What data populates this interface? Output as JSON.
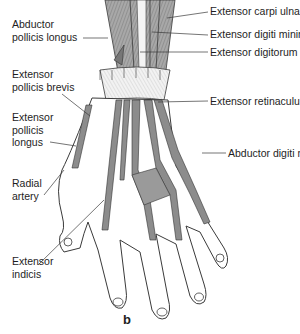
{
  "figure": {
    "subfigure_label": "b",
    "colors": {
      "muscle_fill": "#9a9a9a",
      "tendon_fill": "#8c8c8c",
      "outline": "#3a3a3a",
      "retinaculum_fill": "#f0f0f0",
      "label_text": "#1e1e1e",
      "background": "#ffffff"
    }
  },
  "labels": {
    "left": [
      {
        "line1": "Abductor",
        "line2": "pollicis longus"
      },
      {
        "line1": "Extensor",
        "line2": "pollicis brevis"
      },
      {
        "line1": "Extensor",
        "line2": "pollicis",
        "line3": "longus"
      },
      {
        "line1": "Radial",
        "line2": "artery"
      },
      {
        "line1": "Extensor",
        "line2": "indicis"
      }
    ],
    "right": [
      {
        "text": "Extensor carpi ulnaris"
      },
      {
        "text": "Extensor digiti minimi"
      },
      {
        "text": "Extensor digitorum"
      },
      {
        "text": "Extensor retinaculum"
      },
      {
        "text": "Abductor digiti minmi"
      }
    ]
  }
}
